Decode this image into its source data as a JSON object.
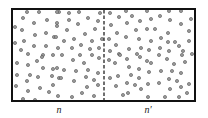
{
  "diagram": {
    "type": "particle-box-partition",
    "box": {
      "x": 12,
      "y": 9,
      "width": 183,
      "height": 92,
      "stroke": "#111111",
      "stroke_width": 2
    },
    "partition": {
      "x": 104,
      "style": "dashed",
      "color": "#333333"
    },
    "particle": {
      "radius": 1.6,
      "fill": "#9a9a9a",
      "stroke": "#555555"
    },
    "labels": {
      "left": {
        "text": "n",
        "x": 59,
        "y": 110
      },
      "right": {
        "text": "n′",
        "x": 148,
        "y": 110
      }
    },
    "particles_left": [
      [
        27,
        12
      ],
      [
        39,
        12
      ],
      [
        59,
        12
      ],
      [
        23,
        18
      ],
      [
        34,
        23
      ],
      [
        47,
        20
      ],
      [
        15,
        27
      ],
      [
        22,
        30
      ],
      [
        35,
        35
      ],
      [
        46,
        33
      ],
      [
        15,
        43
      ],
      [
        24,
        41
      ],
      [
        34,
        46
      ],
      [
        46,
        46
      ],
      [
        54,
        37
      ],
      [
        57,
        26
      ],
      [
        21,
        50
      ],
      [
        43,
        55
      ],
      [
        53,
        55
      ],
      [
        28,
        54
      ],
      [
        57,
        12
      ],
      [
        69,
        13
      ],
      [
        79,
        12
      ],
      [
        100,
        13
      ],
      [
        69,
        20
      ],
      [
        78,
        24
      ],
      [
        88,
        18
      ],
      [
        98,
        21
      ],
      [
        57,
        23
      ],
      [
        67,
        30
      ],
      [
        85,
        34
      ],
      [
        95,
        29
      ],
      [
        56,
        37
      ],
      [
        64,
        41
      ],
      [
        74,
        39
      ],
      [
        92,
        41
      ],
      [
        102,
        39
      ],
      [
        58,
        48
      ],
      [
        72,
        48
      ],
      [
        81,
        45
      ],
      [
        90,
        49
      ],
      [
        99,
        48
      ],
      [
        62,
        55
      ],
      [
        80,
        55
      ],
      [
        92,
        55
      ],
      [
        17,
        63
      ],
      [
        28,
        65
      ],
      [
        37,
        61
      ],
      [
        42,
        57
      ],
      [
        43,
        68
      ],
      [
        53,
        69
      ],
      [
        17,
        75
      ],
      [
        30,
        75
      ],
      [
        38,
        77
      ],
      [
        52,
        76
      ],
      [
        59,
        78
      ],
      [
        16,
        86
      ],
      [
        27,
        81
      ],
      [
        40,
        88
      ],
      [
        53,
        85
      ],
      [
        28,
        91
      ],
      [
        49,
        92
      ],
      [
        23,
        99
      ],
      [
        35,
        100
      ],
      [
        58,
        96
      ],
      [
        73,
        60
      ],
      [
        84,
        63
      ],
      [
        99,
        58
      ],
      [
        57,
        68
      ],
      [
        64,
        70
      ],
      [
        76,
        71
      ],
      [
        88,
        70
      ],
      [
        98,
        73
      ],
      [
        61,
        78
      ],
      [
        74,
        81
      ],
      [
        86,
        77
      ],
      [
        94,
        80
      ],
      [
        87,
        87
      ],
      [
        98,
        85
      ],
      [
        72,
        97
      ],
      [
        82,
        93
      ],
      [
        94,
        96
      ]
    ],
    "particles_right": [
      [
        110,
        13
      ],
      [
        126,
        11
      ],
      [
        147,
        11
      ],
      [
        119,
        17
      ],
      [
        132,
        16
      ],
      [
        140,
        21
      ],
      [
        111,
        25
      ],
      [
        127,
        23
      ],
      [
        136,
        30
      ],
      [
        147,
        29
      ],
      [
        117,
        33
      ],
      [
        126,
        37
      ],
      [
        139,
        39
      ],
      [
        109,
        39
      ],
      [
        151,
        41
      ],
      [
        116,
        45
      ],
      [
        129,
        49
      ],
      [
        141,
        48
      ],
      [
        110,
        51
      ],
      [
        119,
        54
      ],
      [
        137,
        54
      ],
      [
        149,
        50
      ],
      [
        169,
        11
      ],
      [
        181,
        11
      ],
      [
        151,
        19
      ],
      [
        160,
        16
      ],
      [
        170,
        20
      ],
      [
        181,
        24
      ],
      [
        191,
        19
      ],
      [
        155,
        29
      ],
      [
        168,
        33
      ],
      [
        189,
        31
      ],
      [
        161,
        38
      ],
      [
        175,
        42
      ],
      [
        168,
        42
      ],
      [
        189,
        41
      ],
      [
        160,
        48
      ],
      [
        179,
        46
      ],
      [
        183,
        51
      ],
      [
        169,
        51
      ],
      [
        192,
        54
      ],
      [
        109,
        60
      ],
      [
        120,
        55
      ],
      [
        127,
        59
      ],
      [
        140,
        57
      ],
      [
        147,
        61
      ],
      [
        115,
        63
      ],
      [
        129,
        67
      ],
      [
        139,
        69
      ],
      [
        149,
        72
      ],
      [
        110,
        78
      ],
      [
        118,
        76
      ],
      [
        131,
        75
      ],
      [
        139,
        78
      ],
      [
        116,
        86
      ],
      [
        127,
        83
      ],
      [
        135,
        85
      ],
      [
        148,
        84
      ],
      [
        141,
        89
      ],
      [
        123,
        95
      ],
      [
        128,
        93
      ],
      [
        148,
        97
      ],
      [
        159,
        55
      ],
      [
        167,
        59
      ],
      [
        182,
        55
      ],
      [
        185,
        62
      ],
      [
        151,
        63
      ],
      [
        174,
        64
      ],
      [
        161,
        71
      ],
      [
        172,
        71
      ],
      [
        181,
        73
      ],
      [
        169,
        79
      ],
      [
        177,
        81
      ],
      [
        159,
        83
      ],
      [
        181,
        87
      ],
      [
        170,
        89
      ],
      [
        189,
        84
      ],
      [
        187,
        93
      ],
      [
        165,
        97
      ],
      [
        179,
        97
      ]
    ]
  }
}
